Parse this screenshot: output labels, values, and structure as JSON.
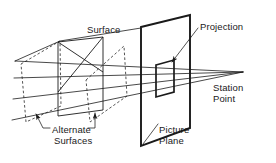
{
  "figure": {
    "type": "technical-line-diagram",
    "background_color": "#ffffff",
    "line_color": "#1a1a1a",
    "text_color": "#1a1a1a"
  },
  "labels": {
    "surface": "Surface",
    "projection": "Projection",
    "station_point_line1": "Station",
    "station_point_line2": "Point",
    "picture_plane_line1": "Picture",
    "picture_plane_line2": "Plane",
    "alternate": "Alternate",
    "surfaces": "Surfaces"
  },
  "geometry": {
    "station_point": {
      "x": 243,
      "y": 72
    },
    "projection_rays": [
      {
        "name": "ray-top",
        "from_x": 15,
        "from_y": 61,
        "to_x": 243,
        "to_y": 72
      },
      {
        "name": "ray-upper-mid",
        "from_x": 14,
        "from_y": 78,
        "to_x": 243,
        "to_y": 72
      },
      {
        "name": "ray-lower-mid",
        "from_x": 13,
        "from_y": 99,
        "to_x": 243,
        "to_y": 72
      },
      {
        "name": "ray-bottom",
        "from_x": 12,
        "from_y": 120,
        "to_x": 243,
        "to_y": 72
      }
    ],
    "top_edge": {
      "from_x": 15,
      "from_y": 61,
      "via_x": 60,
      "via_y": 41,
      "to_x": 141,
      "to_y": 28
    },
    "surface_solid": {
      "description": "Main solid surface quadrilateral with two vertical edges",
      "left_vertical_x": 58,
      "right_vertical_x": 103,
      "points": "58,42 103,37 103,110 58,116"
    },
    "alternate_surface_left": {
      "description": "Dashed alternate surface at far left",
      "points": "21,64 60,41 61,106 26,122"
    },
    "alternate_surface_center": {
      "description": "Dashed alternate surface tilted in center",
      "points": "86,80 124,46 127,96 90,122"
    },
    "picture_plane": {
      "description": "Thick parallelogram representing the picture plane",
      "points": "141,27 190,15 190,128 141,146"
    },
    "projection_rect": {
      "description": "Small thick parallelogram (the projection) on the picture plane",
      "points": "156,65 174,60 174,92 156,97"
    },
    "leaders": {
      "projection_leader": {
        "from_x": 198,
        "from_y": 27,
        "to_x": 170,
        "to_y": 63
      },
      "picture_plane_leader": {
        "from_x": 157,
        "from_y": 124,
        "to_x": 143,
        "to_y": 143
      },
      "alternate_left_leader": {
        "from_x": 35,
        "from_y": 113,
        "to_x": 42,
        "to_y": 127,
        "hook_to_x": 50,
        "hook_to_y": 127
      },
      "alternate_right_leader": {
        "from_x": 95,
        "from_y": 112,
        "to_x": 95,
        "to_y": 127,
        "hook_to_x": 88,
        "hook_to_y": 127
      }
    }
  },
  "icons": {
    "arrowhead": "arrowhead-icon"
  }
}
